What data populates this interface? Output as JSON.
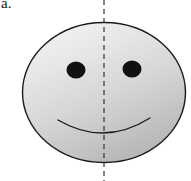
{
  "figure": {
    "part_label": "a.",
    "caption": "",
    "canvas": {
      "width": 191,
      "height": 181,
      "background": "#ffffff"
    },
    "colors": {
      "face_outline": "#1a1a1a",
      "face_fill_light": "#f2f2f2",
      "face_fill_mid": "#d7d7d7",
      "face_fill_dark": "#b8b8b8",
      "eye_fill": "#111111",
      "mouth_stroke": "#1a1a1a",
      "symmetry_line": "#333333"
    },
    "shapes": {
      "face": {
        "name": "smiley-face-ellipse",
        "cx": 104,
        "cy": 92.5,
        "rx": 82,
        "ry": 70.5,
        "stroke_width": 1.4
      },
      "left_eye": {
        "name": "left-eye",
        "cx": 76,
        "cy": 70,
        "rx": 9.5,
        "ry": 8.5
      },
      "right_eye": {
        "name": "right-eye",
        "cx": 132,
        "cy": 69,
        "rx": 9.5,
        "ry": 8.5
      },
      "mouth": {
        "name": "smile-curve",
        "start_x": 58,
        "start_y": 120,
        "end_x": 150,
        "end_y": 118,
        "control_x": 104,
        "control_y": 146,
        "stroke_width": 1.3
      },
      "symmetry_axis": {
        "name": "vertical-line-of-symmetry",
        "x": 104,
        "y_top": 0,
        "y_bottom": 181,
        "stroke_width": 1.2,
        "dash_pattern": "5 4"
      }
    }
  }
}
